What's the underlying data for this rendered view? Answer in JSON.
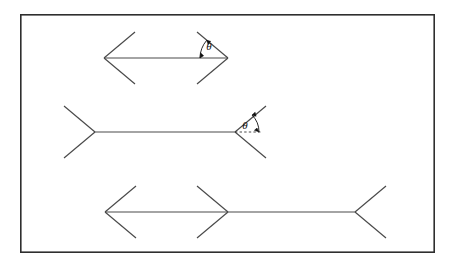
{
  "figure": {
    "background_color": "#ffffff",
    "stroke_color": "#3a3a3a",
    "frame_color": "#2e2e2e",
    "label_color": "#111111",
    "frame": {
      "x": 20,
      "y": 14,
      "width": 415,
      "height": 239,
      "stroke_width": 1.6
    },
    "angle_symbol": "θ",
    "shafts": [
      {
        "name": "top-shaft",
        "label": "top figure - both fins inward (arrowheads)",
        "x1": 104,
        "y1": 58,
        "x2": 228,
        "y2": 58,
        "left_fin": "inward",
        "right_fin": "inward",
        "fin_length": 40,
        "fin_angle_deg": 40
      },
      {
        "name": "middle-shaft",
        "label": "middle figure - both fins outward (tails)",
        "x1": 95,
        "y1": 132,
        "x2": 235,
        "y2": 132,
        "left_fin": "outward",
        "right_fin": "outward",
        "fin_length": 40,
        "fin_angle_deg": 40
      },
      {
        "name": "bottom-shaft",
        "label": "bottom figure - compound: inward, arrowhead, outward",
        "x1": 105,
        "y1": 212,
        "x2": 355,
        "y2": 212,
        "mid_x": 228,
        "left_fin": "inward",
        "mid_fin": "inward",
        "right_fin": "outward",
        "fin_length": 40,
        "fin_angle_deg": 40
      }
    ],
    "angle_annotations": [
      {
        "name": "top-theta",
        "symbol": "θ",
        "vertex_x": 228,
        "vertex_y": 58,
        "label_x": 209,
        "label_y": 48,
        "arc_radius": 30,
        "has_dashed_ray": false,
        "description": "angle between upper inward fin and shaft at right vertex of top figure"
      },
      {
        "name": "middle-theta",
        "symbol": "θ",
        "vertex_x": 235,
        "vertex_y": 132,
        "label_x": 245,
        "label_y": 128,
        "arc_radius": 26,
        "has_dashed_ray": true,
        "dashed_ray_length": 24,
        "description": "angle between upper outward fin and dashed horizontal extension at right vertex of middle figure"
      }
    ]
  }
}
